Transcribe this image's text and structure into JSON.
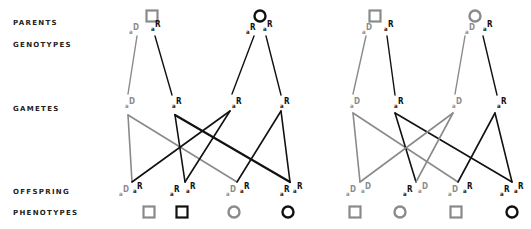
{
  "labels": {
    "parents": "PARENTS",
    "genotypes": "GENOTYPES",
    "gametes": "GAMETES",
    "offspring": "OFFSPRING",
    "phenotypes": "PHENOTYPES"
  },
  "colors": {
    "dominant_grey": "#8a8a8a",
    "recessive_black": "#111111"
  },
  "panels": [
    {
      "name": "left-cross",
      "parents": [
        {
          "shape": "square",
          "color": "grey"
        },
        {
          "shape": "circle",
          "color": "black"
        }
      ],
      "parent_genotypes": [
        [
          {
            "a": "a",
            "b": "D",
            "c": "grey"
          },
          {
            "a": "a",
            "b": "R",
            "c": "black"
          }
        ],
        [
          {
            "a": "a",
            "b": "R",
            "c": "black"
          },
          {
            "a": "a",
            "b": "R",
            "c": "black"
          }
        ]
      ],
      "gametes": [
        {
          "a": "a",
          "b": "D",
          "c": "grey"
        },
        {
          "a": "a",
          "b": "R",
          "c": "black"
        },
        {
          "a": "a",
          "b": "R",
          "c": "black"
        },
        {
          "a": "a",
          "b": "R",
          "c": "black"
        }
      ],
      "offspring": [
        [
          {
            "a": "a",
            "b": "D",
            "c": "grey"
          },
          {
            "a": "a",
            "b": "R",
            "c": "black"
          }
        ],
        [
          {
            "a": "a",
            "b": "R",
            "c": "black"
          },
          {
            "a": "a",
            "b": "R",
            "c": "black"
          }
        ],
        [
          {
            "a": "a",
            "b": "D",
            "c": "grey"
          },
          {
            "a": "a",
            "b": "R",
            "c": "black"
          }
        ],
        [
          {
            "a": "a",
            "b": "R",
            "c": "black"
          },
          {
            "a": "a",
            "b": "R",
            "c": "black"
          }
        ]
      ],
      "phenotypes": [
        {
          "shape": "square",
          "color": "grey"
        },
        {
          "shape": "square",
          "color": "black"
        },
        {
          "shape": "circle",
          "color": "grey"
        },
        {
          "shape": "circle",
          "color": "black"
        }
      ]
    },
    {
      "name": "right-cross",
      "parents": [
        {
          "shape": "square",
          "color": "grey"
        },
        {
          "shape": "circle",
          "color": "grey"
        }
      ],
      "parent_genotypes": [
        [
          {
            "a": "a",
            "b": "D",
            "c": "grey"
          },
          {
            "a": "a",
            "b": "R",
            "c": "black"
          }
        ],
        [
          {
            "a": "a",
            "b": "D",
            "c": "grey"
          },
          {
            "a": "a",
            "b": "R",
            "c": "black"
          }
        ]
      ],
      "gametes": [
        {
          "a": "a",
          "b": "D",
          "c": "grey"
        },
        {
          "a": "a",
          "b": "R",
          "c": "black"
        },
        {
          "a": "a",
          "b": "D",
          "c": "grey"
        },
        {
          "a": "a",
          "b": "R",
          "c": "black"
        }
      ],
      "offspring": [
        [
          {
            "a": "a",
            "b": "D",
            "c": "grey"
          },
          {
            "a": "a",
            "b": "D",
            "c": "grey"
          }
        ],
        [
          {
            "a": "a",
            "b": "R",
            "c": "black"
          },
          {
            "a": "a",
            "b": "D",
            "c": "grey"
          }
        ],
        [
          {
            "a": "a",
            "b": "D",
            "c": "grey"
          },
          {
            "a": "a",
            "b": "R",
            "c": "black"
          }
        ],
        [
          {
            "a": "a",
            "b": "R",
            "c": "black"
          },
          {
            "a": "a",
            "b": "R",
            "c": "black"
          }
        ]
      ],
      "phenotypes": [
        {
          "shape": "square",
          "color": "grey"
        },
        {
          "shape": "circle",
          "color": "grey"
        },
        {
          "shape": "square",
          "color": "grey"
        },
        {
          "shape": "circle",
          "color": "black"
        }
      ]
    }
  ]
}
